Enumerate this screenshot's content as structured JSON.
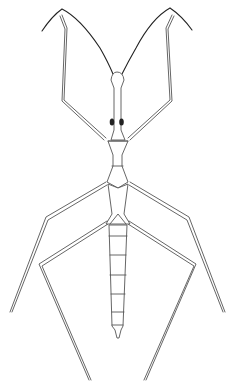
{
  "image": {
    "subject": "water stick insect line drawing",
    "colors": {
      "background": "#ffffff",
      "line": "#555555",
      "eye": "#222222"
    }
  }
}
